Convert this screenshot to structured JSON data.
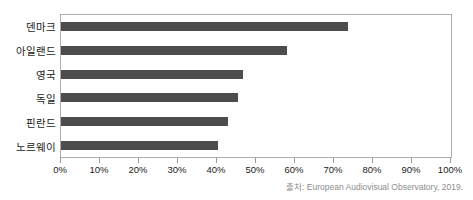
{
  "chart_data": {
    "type": "bar",
    "orientation": "horizontal",
    "title": "",
    "xlabel": "",
    "ylabel": "",
    "xlim": [
      0,
      100
    ],
    "grid": false,
    "legend": null,
    "bar_color": "#4d4d4d",
    "categories": [
      "덴마크",
      "아일랜드",
      "영국",
      "독일",
      "핀란드",
      "노르웨이"
    ],
    "values": [
      73.5,
      58.0,
      46.7,
      45.4,
      42.8,
      40.3
    ],
    "tick_labels": [
      "0%",
      "10%",
      "20%",
      "30%",
      "40%",
      "50%",
      "60%",
      "70%",
      "80%",
      "90%",
      "100%"
    ],
    "tick_values": [
      0,
      10,
      20,
      30,
      40,
      50,
      60,
      70,
      80,
      90,
      100
    ]
  },
  "source": {
    "text": "출처: European Audiovisual Observatory, 2019."
  }
}
